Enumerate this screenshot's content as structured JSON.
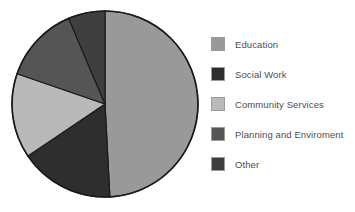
{
  "chart_data": {
    "type": "pie",
    "title": "",
    "subtitle": "",
    "xlabel": "",
    "ylabel": "",
    "legend_position": "right",
    "grid": false,
    "categories": [
      "Education",
      "Social Work",
      "Community Services",
      "Planning and Enviroment",
      "Other"
    ],
    "values": [
      49,
      16,
      15,
      13,
      7
    ],
    "units": "percent",
    "slices": [
      {
        "label": "Education",
        "value": 49,
        "color": "#999999",
        "start_angle": 0,
        "end_angle": 177
      },
      {
        "label": "Social Work",
        "value": 16,
        "color": "#2e2e2e",
        "start_angle": 177,
        "end_angle": 236
      },
      {
        "label": "Community Services",
        "value": 15,
        "color": "#b9b9b9",
        "start_angle": 236,
        "end_angle": 289
      },
      {
        "label": "Planning and Enviroment",
        "value": 13,
        "color": "#555555",
        "start_angle": 289,
        "end_angle": 337
      },
      {
        "label": "Other",
        "value": 7,
        "color": "#3f3f3f",
        "start_angle": 337,
        "end_angle": 360
      }
    ],
    "outline_color": "#1a1a1a",
    "background": "#ffffff"
  },
  "legend": {
    "items": [
      {
        "label": "Education",
        "color": "#999999"
      },
      {
        "label": "Social Work",
        "color": "#2e2e2e"
      },
      {
        "label": "Community Services",
        "color": "#b9b9b9"
      },
      {
        "label": "Planning and Enviroment",
        "color": "#555555"
      },
      {
        "label": "Other",
        "color": "#3f3f3f"
      }
    ]
  }
}
